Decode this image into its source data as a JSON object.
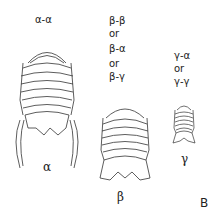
{
  "figure": {
    "panel_label": "B",
    "morphs": [
      {
        "name": "α",
        "pairings": [
          "α-α"
        ]
      },
      {
        "name": "β",
        "pairings": [
          "β-β",
          "or",
          "β-α",
          "or",
          "β-γ"
        ]
      },
      {
        "name": "γ",
        "pairings": [
          "γ-α",
          "or",
          "γ-γ"
        ]
      }
    ]
  }
}
